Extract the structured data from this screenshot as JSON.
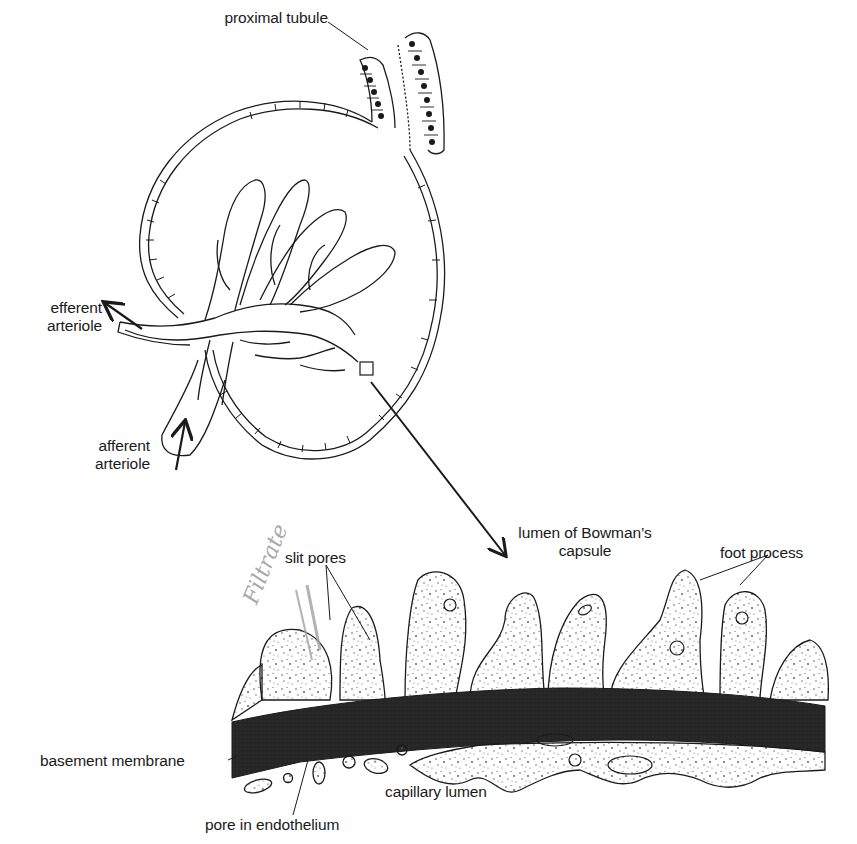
{
  "figure": {
    "colors": {
      "ink": "#1a1a1a",
      "membrane": "#2a2a2a",
      "pencil_annotation": "#9a9a9a",
      "background": "#ffffff"
    }
  },
  "labels": {
    "proximal_tubule": "proximal tubule",
    "efferent_arteriole_line1": "efferent",
    "efferent_arteriole_line2": "arteriole",
    "afferent_arteriole_line1": "afferent",
    "afferent_arteriole_line2": "arteriole",
    "bowmans_lumen_line1": "lumen of Bowman’s",
    "bowmans_lumen_line2": "capsule",
    "slit_pores": "slit pores",
    "foot_process": "foot process",
    "basement_membrane": "basement membrane",
    "capillary_lumen": "capillary lumen",
    "pore_in_endothelium": "pore in endothelium"
  },
  "annotations": {
    "handwritten": "Filtrate"
  }
}
